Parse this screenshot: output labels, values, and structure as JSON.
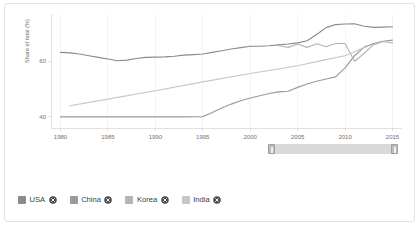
{
  "chart_data": {
    "type": "line",
    "title": "",
    "subtitle": "",
    "xlabel": "",
    "ylabel": "Share of total (%)",
    "xlim": [
      1979,
      2016
    ],
    "ylim": [
      36,
      77
    ],
    "yticks": [
      40,
      60
    ],
    "ytick_labels": [
      "40",
      "60"
    ],
    "xticks": [
      1980,
      1985,
      1990,
      1995,
      2000,
      2005,
      2010,
      2015
    ],
    "xtick_labels": [
      "1980",
      "1985",
      "1990",
      "1995",
      "2000",
      "2005",
      "2010",
      "2015"
    ],
    "grid": "vertical",
    "legend_position": "bottom",
    "series": [
      {
        "name": "USA",
        "color": "#8a8a8a",
        "x": [
          1980,
          1981,
          1982,
          1983,
          1984,
          1985,
          1986,
          1987,
          1988,
          1989,
          1990,
          1991,
          1992,
          1993,
          1994,
          1995,
          1996,
          1997,
          1998,
          1999,
          2000,
          2001,
          2002,
          2003,
          2004,
          2005,
          2006,
          2007,
          2008,
          2009,
          2010,
          2011,
          2012,
          2013,
          2014,
          2015
        ],
        "values": [
          63.2,
          63.0,
          62.6,
          62.0,
          61.4,
          60.8,
          60.2,
          60.4,
          61.0,
          61.4,
          61.5,
          61.6,
          61.8,
          62.2,
          62.4,
          62.6,
          63.2,
          63.8,
          64.4,
          64.9,
          65.4,
          65.4,
          65.6,
          65.9,
          66.2,
          66.6,
          67.4,
          69.6,
          72.1,
          73.2,
          73.4,
          73.5,
          72.6,
          72.2,
          72.3,
          72.4
        ]
      },
      {
        "name": "China",
        "color": "#9a9a9a",
        "x": [
          1980,
          1985,
          1990,
          1993,
          1995,
          1996,
          1997,
          1998,
          1999,
          2000,
          2001,
          2002,
          2003,
          2004,
          2005,
          2006,
          2007,
          2008,
          2009,
          2010,
          2011,
          2012,
          2013,
          2014,
          2015
        ],
        "values": [
          40.0,
          40.0,
          40.0,
          40.0,
          40.1,
          41.6,
          43.2,
          44.6,
          45.8,
          46.8,
          47.6,
          48.4,
          49.0,
          49.2,
          50.6,
          51.8,
          52.8,
          53.6,
          54.4,
          57.6,
          62.0,
          65.0,
          66.4,
          67.2,
          67.6
        ]
      },
      {
        "name": "Korea",
        "color": "#b4b4b4",
        "x": [
          2003,
          2004,
          2005,
          2006,
          2007,
          2008,
          2009,
          2010,
          2011,
          2012,
          2013,
          2014,
          2015
        ],
        "values": [
          65.6,
          65.0,
          66.2,
          65.0,
          66.3,
          65.2,
          66.4,
          66.4,
          60.0,
          62.8,
          66.0,
          67.1,
          66.6
        ]
      },
      {
        "name": "India",
        "color": "#c6c6c6",
        "x": [
          1981,
          1985,
          1990,
          1995,
          2000,
          2003,
          2005,
          2008,
          2010,
          2011,
          2012
        ],
        "values": [
          44.0,
          46.4,
          49.4,
          52.6,
          55.6,
          57.2,
          58.4,
          60.6,
          62.0,
          63.4,
          65.0
        ]
      }
    ]
  },
  "legend": {
    "items": [
      {
        "label": "USA",
        "color": "#8a8a8a",
        "remove_icon": "close-circle-icon"
      },
      {
        "label": "China",
        "color": "#9a9a9a",
        "remove_icon": "close-circle-icon"
      },
      {
        "label": "Korea",
        "color": "#b4b4b4",
        "remove_icon": "close-circle-icon"
      },
      {
        "label": "India",
        "color": "#c6c6c6",
        "remove_icon": "close-circle-icon"
      }
    ]
  },
  "range_slider": {
    "left_handle_icon": "drag-handle-icon",
    "right_handle_icon": "drag-handle-icon"
  }
}
